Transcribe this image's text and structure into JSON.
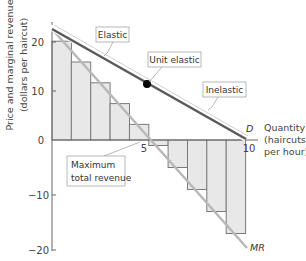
{
  "chart_data": {
    "type": "bar",
    "title": "",
    "xlabel": "Quantity (haircuts per hour)",
    "xlabel_lines": [
      "Quantity",
      "(haircuts",
      "per hour)"
    ],
    "ylabel": "Price and marginal revenue (dollars per haircut)",
    "ylabel_lines": [
      "Price and marginal revenue",
      "(dollars per haircut)"
    ],
    "xlim": [
      0,
      10
    ],
    "ylim": [
      -20,
      22
    ],
    "x_ticks": [
      {
        "value": 5,
        "label": "5"
      },
      {
        "value": 10,
        "label": "10"
      }
    ],
    "y_ticks": [
      {
        "value": 20,
        "label": "20"
      },
      {
        "value": 10,
        "label": "10"
      },
      {
        "value": 0,
        "label": "0"
      },
      {
        "value": -10,
        "label": "−10"
      },
      {
        "value": -20,
        "label": "−20"
      }
    ],
    "grid": false,
    "categories": [
      1,
      2,
      3,
      4,
      5,
      6,
      7,
      8,
      9,
      10
    ],
    "series": [
      {
        "name": "Marginal revenue bars",
        "type": "bar",
        "values": [
          19,
          15,
          11,
          7,
          3,
          -1,
          -5,
          -9,
          -13,
          -17
        ]
      },
      {
        "name": "D",
        "type": "line",
        "label": "D",
        "points": [
          [
            0,
            21
          ],
          [
            10,
            0
          ]
        ]
      },
      {
        "name": "MR",
        "type": "line",
        "label": "MR",
        "points": [
          [
            0,
            21
          ],
          [
            10,
            -20
          ]
        ]
      }
    ],
    "annotations": [
      {
        "text": "Elastic",
        "target": [
          2.6,
          16
        ]
      },
      {
        "text": "Unit elastic",
        "point": [
          4.9,
          10.4
        ]
      },
      {
        "text": "Inelastic",
        "target": [
          7.4,
          5.6
        ]
      },
      {
        "text": "Maximum total revenue",
        "target": [
          4.5,
          0
        ]
      }
    ],
    "legend": "none"
  },
  "labels": {
    "elastic": "Elastic",
    "unit_elastic": "Unit elastic",
    "inelastic": "Inelastic",
    "max_rev_line1": "Maximum",
    "max_rev_line2": "total revenue",
    "demand": "D",
    "mr": "MR"
  },
  "colors": {
    "demand_line": "#5a5a5a",
    "mr_line": "#b8b8b8",
    "bar_fill": "#e8e8e8",
    "bar_stroke": "#7a7a7a",
    "axis": "#666666",
    "dot": "#000000"
  }
}
